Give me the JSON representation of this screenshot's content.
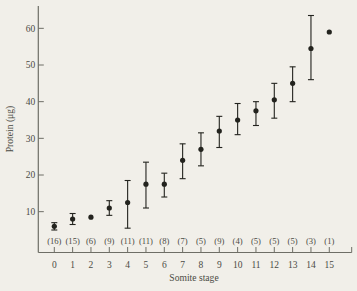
{
  "colors": {
    "background": "#f1efe9",
    "axis": "#6e6e66",
    "text": "#4b4b44",
    "marker": "#23231e"
  },
  "chart_data": {
    "type": "scatter",
    "title": "",
    "xlabel": "Somite stage",
    "ylabel": "Protein (μg)",
    "grid": false,
    "legend": null,
    "xlim": [
      0,
      15
    ],
    "ylim": [
      0,
      65
    ],
    "y_ticks": [
      10,
      20,
      30,
      40,
      50,
      60
    ],
    "x_ticks": [
      0,
      1,
      2,
      3,
      4,
      5,
      6,
      7,
      8,
      9,
      10,
      11,
      12,
      13,
      14,
      15
    ],
    "marker_style": "filled-circle-with-error-bars",
    "series": [
      {
        "name": "mean protein per embryo",
        "points": [
          {
            "stage": 0,
            "n": 16,
            "mean": 6.0,
            "lo": 5.0,
            "hi": 7.0
          },
          {
            "stage": 1,
            "n": 15,
            "mean": 8.0,
            "lo": 6.5,
            "hi": 9.5
          },
          {
            "stage": 2,
            "n": 6,
            "mean": 8.5,
            "lo": 8.5,
            "hi": 8.5
          },
          {
            "stage": 3,
            "n": 9,
            "mean": 11.0,
            "lo": 9.0,
            "hi": 13.0
          },
          {
            "stage": 4,
            "n": 11,
            "mean": 12.5,
            "lo": 5.5,
            "hi": 18.5
          },
          {
            "stage": 5,
            "n": 11,
            "mean": 17.5,
            "lo": 11.0,
            "hi": 23.5
          },
          {
            "stage": 6,
            "n": 8,
            "mean": 17.5,
            "lo": 14.0,
            "hi": 20.5
          },
          {
            "stage": 7,
            "n": 7,
            "mean": 24.0,
            "lo": 19.0,
            "hi": 28.5
          },
          {
            "stage": 8,
            "n": 5,
            "mean": 27.0,
            "lo": 22.5,
            "hi": 31.5
          },
          {
            "stage": 9,
            "n": 9,
            "mean": 32.0,
            "lo": 27.5,
            "hi": 36.0
          },
          {
            "stage": 10,
            "n": 4,
            "mean": 35.0,
            "lo": 31.0,
            "hi": 39.5
          },
          {
            "stage": 11,
            "n": 5,
            "mean": 37.5,
            "lo": 33.5,
            "hi": 40.0
          },
          {
            "stage": 12,
            "n": 5,
            "mean": 40.5,
            "lo": 35.5,
            "hi": 45.0
          },
          {
            "stage": 13,
            "n": 5,
            "mean": 45.0,
            "lo": 40.0,
            "hi": 49.5
          },
          {
            "stage": 14,
            "n": 3,
            "mean": 54.5,
            "lo": 46.0,
            "hi": 63.5
          },
          {
            "stage": 15,
            "n": 1,
            "mean": 59.0,
            "lo": 59.0,
            "hi": 59.0
          }
        ]
      }
    ]
  }
}
